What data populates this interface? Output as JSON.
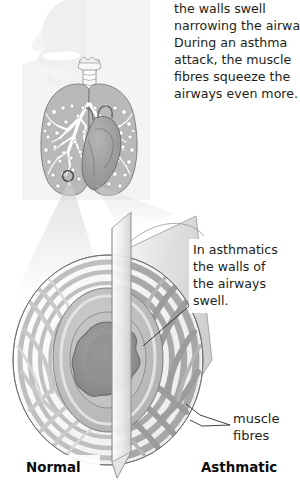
{
  "figure": {
    "background_color": "#ffffff",
    "text_color": "#231f20"
  },
  "callouts": {
    "top_paragraph": {
      "name": "airway-narrowing-description",
      "lines": [
        "the walls swell",
        "narrowing the airway.",
        "During an asthma",
        "attack, the muscle",
        "fibres squeeze the",
        "airways even more."
      ]
    },
    "middle_paragraph": {
      "name": "asthmatic-wall-swelling-note",
      "lines": [
        "In asthmatics",
        "the walls of",
        "the airways",
        "swell."
      ]
    },
    "muscle_label": {
      "name": "muscle-fibres-label",
      "lines": [
        "muscle",
        "fibres"
      ]
    }
  },
  "comparison_labels": {
    "left": "Normal",
    "right": "Asthmatic"
  },
  "anatomy": {
    "body_silhouette": "head-and-torso-profile",
    "trachea": "trachea-with-cartilage-rings",
    "left_lung": "left-lung",
    "right_lung": "right-lung",
    "heart": "heart",
    "bronchial_tree": "bronchial-tree",
    "alveoli_marker": "circled-alveolus"
  },
  "airway_model": {
    "name": "magnified-airway-tube",
    "cutting_plane": "sagittal-cut-plane",
    "lumen": "airway-lumen",
    "mucosa": "airway-wall-mucosa",
    "muscle_rings": "smooth-muscle-fibre-bands",
    "magnifier_cone": "magnification-cone"
  },
  "colors": {
    "silhouette": "#f2f2f2",
    "lung_fill": "#b9b9b9",
    "heart_fill": "#9e9e9e",
    "tube_light": "#e8e8e8",
    "tube_mid": "#c4c4c4",
    "tube_dark": "#9a9a9a",
    "lumen": "#8c8c8c",
    "outline": "#4d4d4d"
  }
}
